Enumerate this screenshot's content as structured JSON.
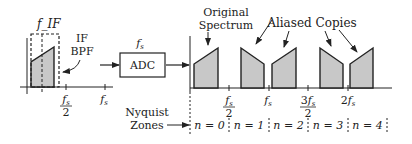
{
  "diagram": {
    "left_plot": {
      "center_label": "f_IF",
      "filter_label_line1": "IF",
      "filter_label_line2": "BPF",
      "ticks": [
        {
          "num": "f",
          "sub": "s",
          "den": "2"
        },
        {
          "num": "f",
          "sub": "s",
          "den": ""
        }
      ]
    },
    "adc": {
      "label": "ADC",
      "clock_label": "f",
      "clock_sub": "s"
    },
    "right_plot": {
      "original_label_line1": "Original",
      "original_label_line2": "Spectrum",
      "aliased_label": "Aliased Copies",
      "ticks": [
        {
          "num": "f",
          "pre": "",
          "sub": "s",
          "den": "2"
        },
        {
          "num": "f",
          "pre": "",
          "sub": "s",
          "den": ""
        },
        {
          "num": "f",
          "pre": "3",
          "sub": "s",
          "den": "2"
        },
        {
          "num": "f",
          "pre": "2",
          "sub": "s",
          "den": ""
        }
      ],
      "nyquist_label_line1": "Nyquist",
      "nyquist_label_line2": "Zones",
      "zones": [
        "n = 0",
        "n = 1",
        "n = 2",
        "n = 3",
        "n = 4"
      ]
    },
    "colors": {
      "fill": "#c8c8c8",
      "stroke": "#222222"
    }
  }
}
